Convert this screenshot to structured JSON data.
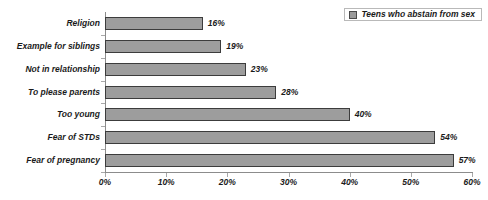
{
  "chart_data": {
    "type": "bar",
    "orientation": "horizontal",
    "title": "",
    "xlabel": "",
    "ylabel": "",
    "categories": [
      "Religion",
      "Example for siblings",
      "Not in relationship",
      "To please parents",
      "Too young",
      "Fear of STDs",
      "Fear of pregnancy"
    ],
    "values": [
      16,
      19,
      23,
      28,
      40,
      54,
      57
    ],
    "value_labels": [
      "16%",
      "19%",
      "23%",
      "28%",
      "40%",
      "54%",
      "57%"
    ],
    "series": [
      {
        "name": "Teens who abstain from sex",
        "values": [
          16,
          19,
          23,
          28,
          40,
          54,
          57
        ]
      }
    ],
    "xlim": [
      0,
      60
    ],
    "xticks": [
      0,
      10,
      20,
      30,
      40,
      50,
      60
    ],
    "xtick_labels": [
      "0%",
      "10%",
      "20%",
      "30%",
      "40%",
      "50%",
      "60%"
    ],
    "grid": false,
    "legend": {
      "position": "top-right",
      "entries": [
        {
          "label": "Teens who abstain from sex",
          "color": "#9a9a9a"
        }
      ]
    },
    "colors": {
      "bar_fill": "#9d9d9d",
      "bar_border": "#3c3c3c",
      "axis": "#8c8c8c",
      "text": "#1a1a1a",
      "background": "#ffffff"
    }
  }
}
